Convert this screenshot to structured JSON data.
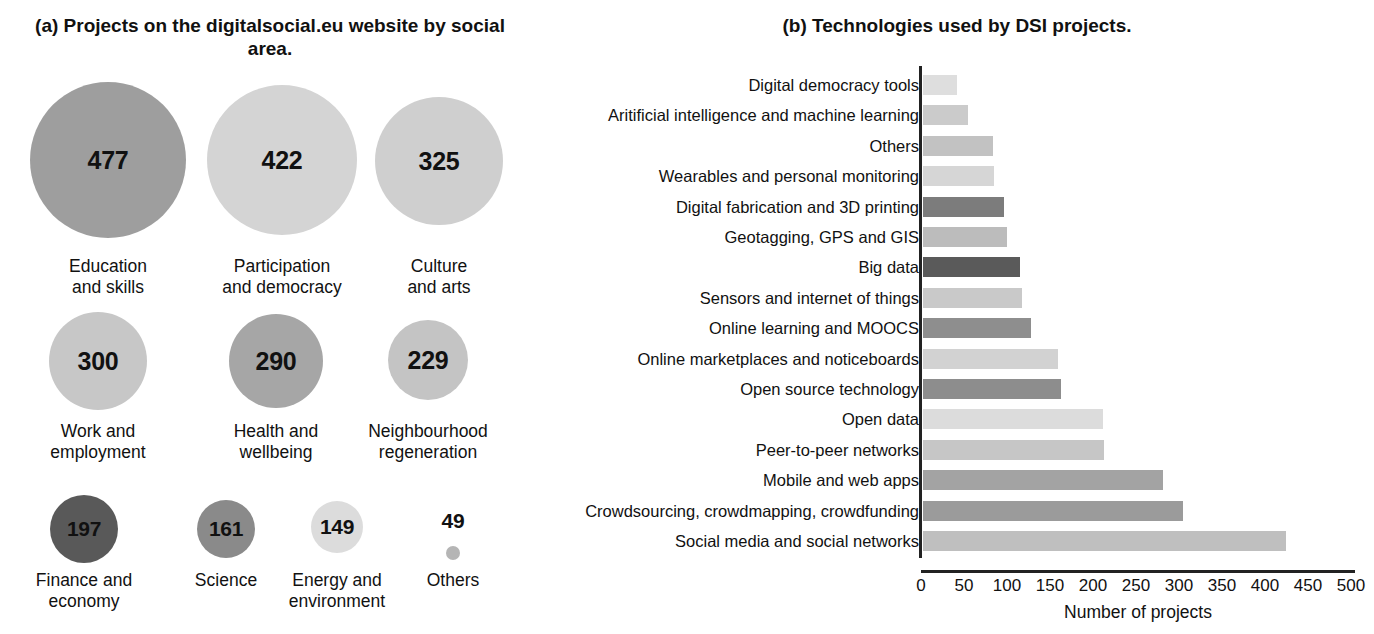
{
  "figure": {
    "background": "#ffffff",
    "text_color": "#111111"
  },
  "panel_a": {
    "title": "(a) Projects on the digitalsocial.eu website by social area.",
    "chart_data": {
      "type": "bar",
      "subtype": "bubble",
      "title": "(a) Projects on the digitalsocial.eu website by social area.",
      "xlabel": "",
      "ylabel": "",
      "categories": [
        "Education and skills",
        "Participation and democracy",
        "Culture and arts",
        "Work and employment",
        "Health and wellbeing",
        "Neighbourhood regeneration",
        "Finance and economy",
        "Science",
        "Energy and environment",
        "Others"
      ],
      "values": [
        477,
        422,
        325,
        300,
        290,
        229,
        197,
        161,
        149,
        49
      ],
      "bubbles": [
        {
          "label": "Education\nand skills",
          "value": "477",
          "cx": 108,
          "cy": 160,
          "d": 156,
          "color": "#9e9e9e",
          "label_y": 256,
          "show_value_inside": true
        },
        {
          "label": "Participation\nand democracy",
          "value": "422",
          "cx": 282,
          "cy": 160,
          "d": 150,
          "color": "#d4d4d4",
          "label_y": 256,
          "show_value_inside": true
        },
        {
          "label": "Culture\nand arts",
          "value": "325",
          "cx": 439,
          "cy": 161,
          "d": 128,
          "color": "#cfcfcf",
          "label_y": 256,
          "show_value_inside": true
        },
        {
          "label": "Work and\nemployment",
          "value": "300",
          "cx": 98,
          "cy": 361,
          "d": 98,
          "color": "#c7c7c7",
          "label_y": 421,
          "show_value_inside": true
        },
        {
          "label": "Health and\nwellbeing",
          "value": "290",
          "cx": 276,
          "cy": 361,
          "d": 94,
          "color": "#a6a6a6",
          "label_y": 421,
          "show_value_inside": true
        },
        {
          "label": "Neighbourhood\nregeneration",
          "value": "229",
          "cx": 428,
          "cy": 360,
          "d": 80,
          "color": "#c4c4c4",
          "label_y": 421,
          "show_value_inside": true
        },
        {
          "label": "Finance and\neconomy",
          "value": "197",
          "cx": 84,
          "cy": 529,
          "d": 68,
          "color": "#595959",
          "label_y": 570,
          "show_value_inside": true
        },
        {
          "label": "Science",
          "value": "161",
          "cx": 226,
          "cy": 529,
          "d": 58,
          "color": "#8a8a8a",
          "label_y": 570,
          "show_value_inside": true
        },
        {
          "label": "Energy and\nenvironment",
          "value": "149",
          "cx": 337,
          "cy": 527,
          "d": 52,
          "color": "#dcdcdc",
          "label_y": 570,
          "show_value_inside": true
        },
        {
          "label": "Others",
          "value": "49",
          "cx": 453,
          "cy": 553,
          "d": 14,
          "color": "#b5b5b5",
          "label_y": 570,
          "show_value_inside": false,
          "value_y": 521
        }
      ]
    }
  },
  "panel_b": {
    "title": "(b) Technologies used by DSI projects.",
    "chart_data": {
      "type": "bar",
      "orientation": "horizontal",
      "title": "(b) Technologies used by DSI projects.",
      "xlabel": "Number of projects",
      "ylabel": "",
      "xlim": [
        0,
        500
      ],
      "xticks": [
        0,
        50,
        100,
        150,
        200,
        250,
        300,
        350,
        400,
        450,
        500
      ],
      "grid": false,
      "legend": "none",
      "categories": [
        "Digital democracy tools",
        "Aritificial intelligence and machine learning",
        "Others",
        "Wearables and personal monitoring",
        "Digital fabrication and 3D printing",
        "Geotagging, GPS and GIS",
        "Big data",
        "Sensors and internet of things",
        "Online learning and MOOCS",
        "Online marketplaces and noticeboards",
        "Open source technology",
        "Open data",
        "Peer-to-peer networks",
        "Mobile and web apps",
        "Crowdsourcing, crowdmapping, crowdfunding",
        "Social media and social networks"
      ],
      "values": [
        40,
        52,
        81,
        83,
        94,
        98,
        113,
        115,
        126,
        157,
        160,
        209,
        210,
        279,
        302,
        422
      ],
      "bar_colors": [
        "#dedede",
        "#cbcbcb",
        "#c2c2c2",
        "#d6d6d6",
        "#7c7c7c",
        "#bcbcbc",
        "#5a5a5a",
        "#c9c9c9",
        "#8e8e8e",
        "#d2d2d2",
        "#8d8d8d",
        "#dcdcdc",
        "#c6c6c6",
        "#a3a3a3",
        "#9b9b9b",
        "#bfbfbf"
      ]
    }
  }
}
